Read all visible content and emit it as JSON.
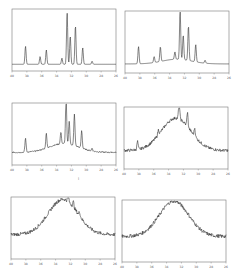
{
  "chart_data": [
    {
      "type": "line",
      "panel": "top-left",
      "title": "",
      "xlabel": "2θ",
      "ylabel": "",
      "x_ticks": [
        "40",
        "38",
        "36",
        "34",
        "32",
        "30",
        "28",
        "26"
      ],
      "peaks": [
        {
          "x": 0.13,
          "h": 0.35
        },
        {
          "x": 0.27,
          "h": 0.15
        },
        {
          "x": 0.33,
          "h": 0.28
        },
        {
          "x": 0.48,
          "h": 0.12
        },
        {
          "x": 0.53,
          "h": 1.0
        },
        {
          "x": 0.56,
          "h": 0.55
        },
        {
          "x": 0.61,
          "h": 0.75
        },
        {
          "x": 0.68,
          "h": 0.32
        },
        {
          "x": 0.77,
          "h": 0.06
        }
      ],
      "baseline": 0.08,
      "amorphous_hump": 0.0,
      "noise": 0.0
    },
    {
      "type": "line",
      "panel": "top-right",
      "xlabel": "2θ",
      "x_ticks": [
        "40",
        "38",
        "36",
        "34",
        "32",
        "30",
        "28",
        "26"
      ],
      "peaks": [
        {
          "x": 0.13,
          "h": 0.35
        },
        {
          "x": 0.28,
          "h": 0.12
        },
        {
          "x": 0.34,
          "h": 0.3
        },
        {
          "x": 0.48,
          "h": 0.15
        },
        {
          "x": 0.53,
          "h": 1.0
        },
        {
          "x": 0.56,
          "h": 0.5
        },
        {
          "x": 0.61,
          "h": 0.7
        },
        {
          "x": 0.68,
          "h": 0.35
        },
        {
          "x": 0.77,
          "h": 0.06
        }
      ],
      "baseline": 0.12,
      "amorphous_hump": 0.08,
      "noise": 0.0
    },
    {
      "type": "line",
      "panel": "middle-left",
      "xlabel": "2θ",
      "x_ticks": [
        "40",
        "38",
        "36",
        "34",
        "32",
        "30",
        "28",
        "26"
      ],
      "peaks": [
        {
          "x": 0.13,
          "h": 0.3
        },
        {
          "x": 0.33,
          "h": 0.32
        },
        {
          "x": 0.47,
          "h": 0.25
        },
        {
          "x": 0.52,
          "h": 1.0
        },
        {
          "x": 0.55,
          "h": 0.5
        },
        {
          "x": 0.6,
          "h": 0.68
        },
        {
          "x": 0.67,
          "h": 0.38
        },
        {
          "x": 0.77,
          "h": 0.06
        }
      ],
      "baseline": 0.18,
      "amorphous_hump": 0.15,
      "noise": 0.01
    },
    {
      "type": "line",
      "panel": "middle-right",
      "xlabel": "2θ",
      "x_ticks": [
        "40",
        "38",
        "36",
        "34",
        "32",
        "30",
        "28",
        "26"
      ],
      "peaks": [
        {
          "x": 0.13,
          "h": 0.2
        },
        {
          "x": 0.33,
          "h": 0.12
        },
        {
          "x": 0.53,
          "h": 0.45
        },
        {
          "x": 0.61,
          "h": 0.35
        },
        {
          "x": 0.68,
          "h": 0.2
        }
      ],
      "baseline": 0.28,
      "amorphous_hump": 0.55,
      "noise": 0.025
    },
    {
      "type": "line",
      "panel": "bottom-left",
      "xlabel": "2θ",
      "x_ticks": [
        "40",
        "38",
        "36",
        "34",
        "32",
        "30",
        "28",
        "26"
      ],
      "peaks": [
        {
          "x": 0.55,
          "h": 0.2
        },
        {
          "x": 0.6,
          "h": 0.15
        },
        {
          "x": 0.66,
          "h": 0.12
        }
      ],
      "baseline": 0.38,
      "amorphous_hump": 0.6,
      "noise": 0.03
    },
    {
      "type": "line",
      "panel": "bottom-right",
      "xlabel": "2θ",
      "x_ticks": [
        "40",
        "38",
        "36",
        "34",
        "32",
        "30",
        "28",
        "26"
      ],
      "peaks": [],
      "baseline": 0.4,
      "amorphous_hump": 0.6,
      "noise": 0.03
    }
  ],
  "annotations": {
    "stray_mark_middle": "i"
  }
}
